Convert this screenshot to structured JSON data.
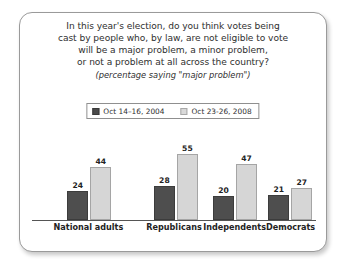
{
  "card": {
    "title_lines": [
      "In this year's election, do you think votes being",
      "cast by people who, by law, are not eligible to vote",
      "will be a major problem, a minor problem,",
      "or not a problem at all across the country?"
    ],
    "subtitle": "(percentage saying \"major problem\")"
  },
  "legend": {
    "items": [
      {
        "label": "Oct 14–16, 2004",
        "color": "#4a4a4a",
        "swatch": "dark"
      },
      {
        "label": "Oct 23-26, 2008",
        "color": "#d9d9d9",
        "swatch": "light"
      }
    ]
  },
  "chart_data": {
    "type": "bar",
    "subtitle": "(percentage saying \"major problem\")",
    "categories": [
      "National adults",
      "Republicans",
      "Independents",
      "Democrats"
    ],
    "series": [
      {
        "name": "Oct 14–16, 2004",
        "color": "#4a4a4a",
        "values": [
          24,
          28,
          20,
          21
        ]
      },
      {
        "name": "Oct 23-26, 2008",
        "color": "#d6d6d6",
        "values": [
          44,
          55,
          47,
          27
        ]
      }
    ],
    "xlabel": "",
    "ylabel": "",
    "ylim": [
      0,
      60
    ],
    "grid": false,
    "legend_position": "top-center",
    "value_labels": true
  }
}
